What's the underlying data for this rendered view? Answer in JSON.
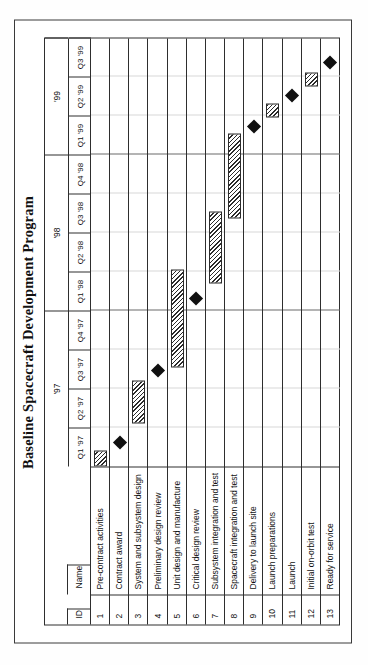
{
  "figure": {
    "title": "Baseline Spacecraft Development Program"
  },
  "columns": {
    "id_header": "ID",
    "name_header": "Name"
  },
  "timeline": {
    "years": [
      {
        "label": "'97",
        "quarters": 4
      },
      {
        "label": "'98",
        "quarters": 4
      },
      {
        "label": "'99",
        "quarters": 3
      }
    ],
    "quarters": [
      "Q1 '97",
      "Q2 '97",
      "Q3 '97",
      "Q4 '97",
      "Q1 '98",
      "Q2 '98",
      "Q3 '98",
      "Q4 '98",
      "Q1 '99",
      "Q2 '99",
      "Q3 '99"
    ]
  },
  "chart_data": {
    "type": "bar",
    "title": "Baseline Spacecraft Development Program",
    "xlabel": "",
    "ylabel": "",
    "categories": [
      "Pre-contract activities",
      "Contract award",
      "System and subsystem design",
      "Preliminary design review",
      "Unit design and manufacture",
      "Critical design review",
      "Subsystem integration and test",
      "Spacecraft integration and test",
      "Delivery to launch site",
      "Launch preparations",
      "Launch",
      "Initial on-orbit test",
      "Ready for service"
    ],
    "x": [
      "Q1 '97",
      "Q2 '97",
      "Q3 '97",
      "Q4 '97",
      "Q1 '98",
      "Q2 '98",
      "Q3 '98",
      "Q4 '98",
      "Q1 '99",
      "Q2 '99",
      "Q3 '99"
    ],
    "xlim": [
      0,
      11
    ],
    "grid": true,
    "legend": "none",
    "tasks": [
      {
        "id": "1",
        "name": "Pre-contract activities",
        "kind": "bar",
        "start": 0.0,
        "end": 0.4
      },
      {
        "id": "2",
        "name": "Contract award",
        "kind": "milestone",
        "at": 0.62
      },
      {
        "id": "3",
        "name": "System and subsystem design",
        "kind": "bar",
        "start": 1.1,
        "end": 2.2
      },
      {
        "id": "4",
        "name": "Preliminary design review",
        "kind": "milestone",
        "at": 2.45
      },
      {
        "id": "5",
        "name": "Unit design and manufacture",
        "kind": "bar",
        "start": 2.55,
        "end": 5.05
      },
      {
        "id": "6",
        "name": "Critical design review",
        "kind": "milestone",
        "at": 4.3
      },
      {
        "id": "7",
        "name": "Subsystem integration and test",
        "kind": "bar",
        "start": 4.7,
        "end": 6.55
      },
      {
        "id": "8",
        "name": "Spacecraft integration and test",
        "kind": "bar",
        "start": 6.35,
        "end": 8.55
      },
      {
        "id": "9",
        "name": "Delivery to launch site",
        "kind": "milestone",
        "at": 8.72
      },
      {
        "id": "10",
        "name": "Launch preparations",
        "kind": "bar",
        "start": 8.95,
        "end": 9.3
      },
      {
        "id": "11",
        "name": "Launch",
        "kind": "milestone",
        "at": 9.52
      },
      {
        "id": "12",
        "name": "Initial on-orbit test",
        "kind": "bar",
        "start": 9.75,
        "end": 10.1
      },
      {
        "id": "13",
        "name": "Ready for service",
        "kind": "milestone",
        "at": 10.35
      }
    ]
  },
  "colors": {
    "bar_fill": "#2b2b2b",
    "milestone": "#101010",
    "frame": "#2e2e2e",
    "grid": "#d8d8d8"
  }
}
